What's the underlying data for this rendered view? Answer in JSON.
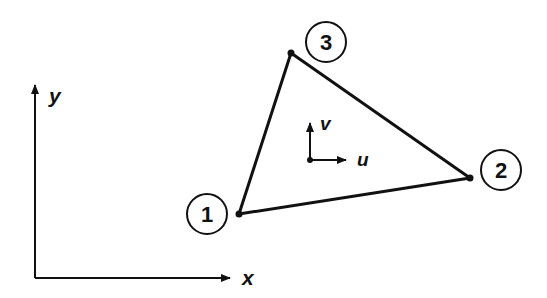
{
  "diagram": {
    "axes": {
      "x_label": "x",
      "y_label": "y"
    },
    "local_axes": {
      "u_label": "u",
      "v_label": "v"
    },
    "nodes": [
      {
        "id": "1",
        "x": 239,
        "y": 214,
        "label_x": 207,
        "label_y": 214
      },
      {
        "id": "2",
        "x": 470,
        "y": 178,
        "label_x": 501,
        "label_y": 170
      },
      {
        "id": "3",
        "x": 291,
        "y": 53,
        "label_x": 326,
        "label_y": 42
      }
    ],
    "color": "#111111"
  }
}
